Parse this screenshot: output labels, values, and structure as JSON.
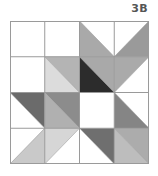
{
  "label": "3B",
  "grid": {
    "rows": 4,
    "cols": 4,
    "line_color": "#9a9a9a",
    "cells": [
      [
        {
          "type": "solid",
          "fill": "#ffffff"
        },
        {
          "type": "solid",
          "fill": "#ffffff"
        },
        {
          "type": "diag",
          "dir": "tlbr",
          "a": "#ffffff",
          "b": "#a9a9a9"
        },
        {
          "type": "diag",
          "dir": "trbl",
          "a": "#ffffff",
          "b": "#9a9a9a"
        }
      ],
      [
        {
          "type": "solid",
          "fill": "#ffffff"
        },
        {
          "type": "diag",
          "dir": "tlbr",
          "a": "#b4b4b4",
          "b": "#dcdcdc"
        },
        {
          "type": "diag",
          "dir": "tlbr",
          "a": "#a9a9a9",
          "b": "#2c2c2c"
        },
        {
          "type": "diag",
          "dir": "trbl",
          "a": "#aaaaaa",
          "b": "#ffffff"
        }
      ],
      [
        {
          "type": "diag",
          "dir": "tlbr",
          "a": "#6b6b6b",
          "b": "#ffffff"
        },
        {
          "type": "diag",
          "dir": "tlbr",
          "a": "#8c8c8c",
          "b": "#b0b0b0"
        },
        {
          "type": "solid",
          "fill": "#ffffff"
        },
        {
          "type": "diag",
          "dir": "tlbr",
          "a": "#ffffff",
          "b": "#858585"
        }
      ],
      [
        {
          "type": "diag",
          "dir": "trbl",
          "a": "#ffffff",
          "b": "#c9c9c9"
        },
        {
          "type": "diag",
          "dir": "trbl",
          "a": "#d6d6d6",
          "b": "#ffffff"
        },
        {
          "type": "diag",
          "dir": "tlbr",
          "a": "#6f6f6f",
          "b": "#ffffff"
        },
        {
          "type": "diag",
          "dir": "tlbr",
          "a": "#acacac",
          "b": "#bdbdbd"
        }
      ]
    ]
  }
}
